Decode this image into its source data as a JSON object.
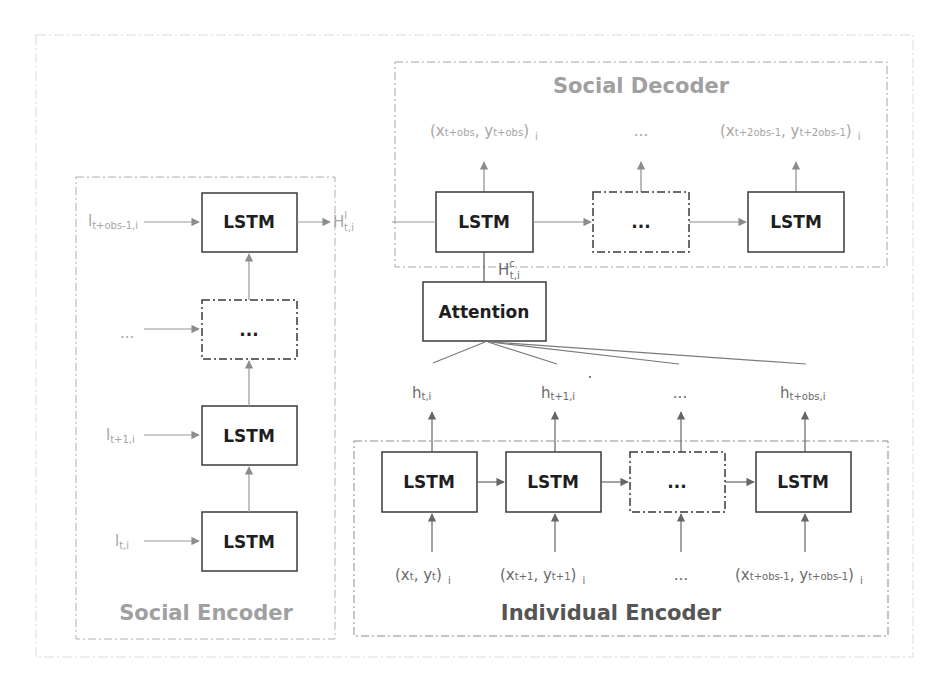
{
  "figure": {
    "social_decoder": {
      "title": "Social Decoder",
      "outputs": [
        {
          "x": "x",
          "x_sub": "t+obs",
          "y": "y",
          "y_sub": "t+obs",
          "idx": "i"
        },
        {
          "ellipsis": "..."
        },
        {
          "x": "x",
          "x_sub": "t+2obs-1",
          "y": "y",
          "y_sub": "t+2obs-1",
          "idx": "i"
        }
      ],
      "cells": [
        "LSTM",
        "...",
        "LSTM"
      ]
    },
    "social_encoder": {
      "title": "Social Encoder",
      "inputs": [
        {
          "base": "l",
          "sub": "t+obs-1,i"
        },
        {
          "ellipsis": "..."
        },
        {
          "base": "l",
          "sub": "t+1,i"
        },
        {
          "base": "l",
          "sub": "t,i"
        }
      ],
      "cells": [
        "LSTM",
        "...",
        "LSTM",
        "LSTM"
      ],
      "output": {
        "base": "H",
        "sup": "l",
        "sub": "t,i"
      }
    },
    "attention": {
      "label": "Attention",
      "output": {
        "base": "H",
        "sup": "c",
        "sub": "t,i"
      }
    },
    "individual_encoder": {
      "title": "Individual Encoder",
      "hidden": [
        {
          "base": "h",
          "sub": "t,i"
        },
        {
          "base": "h",
          "sub": "t+1,i"
        },
        {
          "ellipsis": "..."
        },
        {
          "base": "h",
          "sub": "t+obs,i"
        }
      ],
      "cells": [
        "LSTM",
        "LSTM",
        "...",
        "LSTM"
      ],
      "inputs": [
        {
          "x": "x",
          "x_sub": "t",
          "y": "y",
          "y_sub": "t",
          "idx": "i"
        },
        {
          "x": "x",
          "x_sub": "t+1",
          "y": "y",
          "y_sub": "t+1",
          "idx": "i"
        },
        {
          "ellipsis": "..."
        },
        {
          "x": "x",
          "x_sub": "t+obs-1",
          "y": "y",
          "y_sub": "t+obs-1",
          "idx": "i"
        }
      ]
    },
    "colors": {
      "box_stroke": "#3a3a3a",
      "arrow": "#8c8c8c",
      "frame_stroke": "#9a9a9a",
      "light_title": "#a0a0a0",
      "dark_title": "#555555"
    }
  }
}
